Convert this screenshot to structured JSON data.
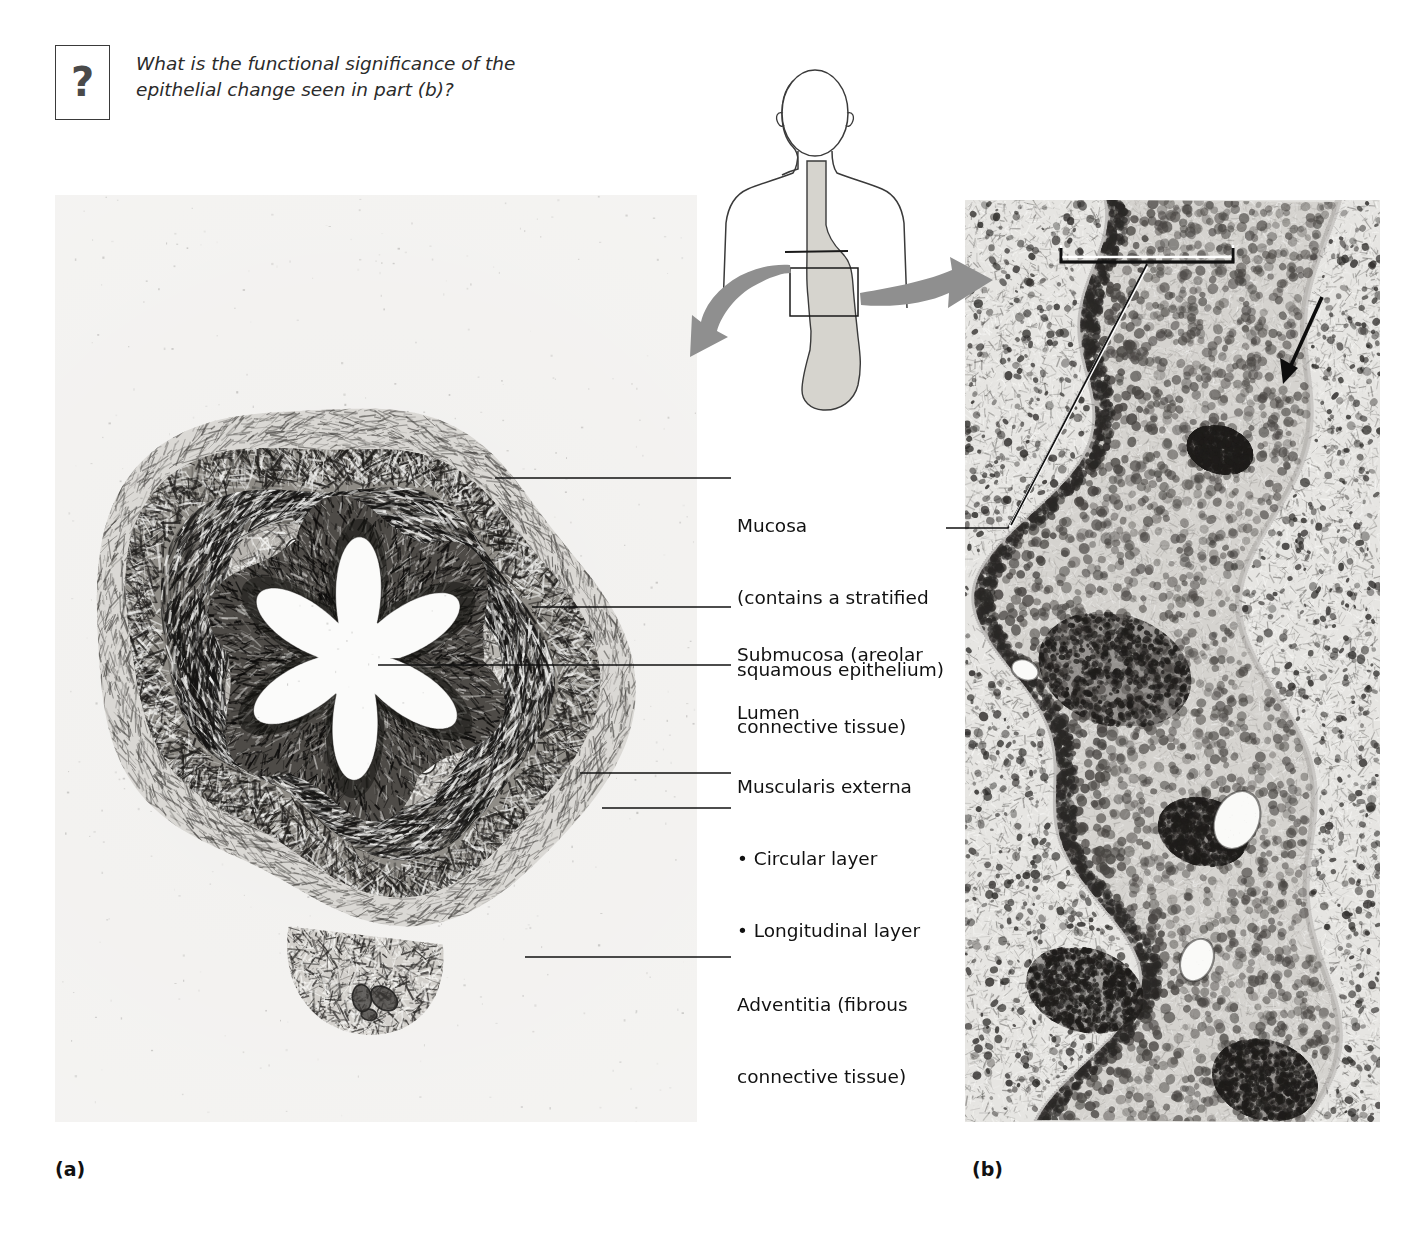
{
  "figure": {
    "question_icon": "?",
    "question_text": "What is the functional significance of the epithelial change seen in part (b)?",
    "top_cut_text": ""
  },
  "panels": [
    {
      "id": "a",
      "caption": "(a)",
      "description": "low-power cross-section of the esophagus showing the star-shaped lumen"
    },
    {
      "id": "b",
      "caption": "(b)",
      "description": "high-power view of stratified squamous epithelium of the esophageal mucosa"
    }
  ],
  "labels": {
    "mucosa": {
      "line1": "Mucosa",
      "line2": "(contains a stratified",
      "line3": "squamous epithelium)"
    },
    "submucosa": {
      "line1": "Submucosa (areolar",
      "line2": "connective tissue)"
    },
    "lumen": {
      "line1": "Lumen"
    },
    "muscularis": {
      "line1": "Muscularis externa",
      "line2": "• Circular layer",
      "line3": "• Longitudinal layer"
    },
    "adventitia": {
      "line1": "Adventitia (fibrous",
      "line2": "connective tissue)"
    }
  },
  "orientation_diagram": {
    "description": "head-and-torso outline with esophagus descending to the stomach; boxed region at the gastroesophageal junction with arrows to panels a and b",
    "colors": {
      "outline": "#3a3a3a",
      "organ_fill": "#d6d4ce",
      "arrow_fill": "#8f8f8f"
    }
  },
  "annotations": {
    "bracket_label": "epithelium-bracket",
    "arrow_label": "junction-arrow"
  },
  "colors": {
    "ink": "#111111",
    "leader": "#111111",
    "panel_base": "#efefed",
    "question_border": "#3a3a3a"
  }
}
